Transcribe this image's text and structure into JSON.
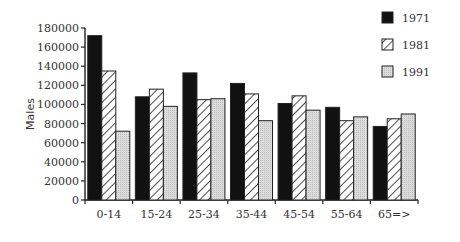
{
  "chart_data": {
    "type": "bar",
    "title": "",
    "xlabel": "",
    "ylabel": "Males",
    "ylim": [
      0,
      180000
    ],
    "yticks": [
      0,
      20000,
      40000,
      60000,
      80000,
      100000,
      120000,
      140000,
      160000,
      180000
    ],
    "grid": false,
    "legend_position": "top-right",
    "categories": [
      "0-14",
      "15-24",
      "25-34",
      "35-44",
      "45-54",
      "55-64",
      "65=>"
    ],
    "series": [
      {
        "name": "1971",
        "pattern": "solid-black",
        "values": [
          172000,
          108000,
          133000,
          122000,
          101000,
          97000,
          77000
        ]
      },
      {
        "name": "1981",
        "pattern": "diagonal-hatch",
        "values": [
          135000,
          116000,
          105000,
          111000,
          109000,
          83000,
          85000
        ]
      },
      {
        "name": "1991",
        "pattern": "light-gray-dotted",
        "values": [
          72000,
          98000,
          106000,
          83000,
          94000,
          87000,
          90000
        ]
      }
    ]
  },
  "legend": {
    "items": [
      {
        "label": "1971"
      },
      {
        "label": "1981"
      },
      {
        "label": "1991"
      }
    ]
  },
  "colors": {
    "s1971": "#111111",
    "s1981_bg": "#ffffff",
    "s1981_hatch": "#222222",
    "s1991": "#d9d9d9",
    "axis": "#222222"
  }
}
